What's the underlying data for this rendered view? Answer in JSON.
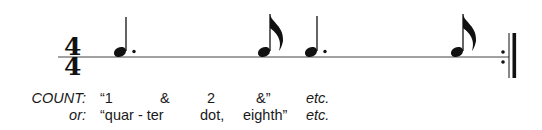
{
  "notation": {
    "time_signature": {
      "numerator": "4",
      "denominator": "4"
    },
    "notes": [
      {
        "type": "dotted-quarter",
        "x": 118
      },
      {
        "type": "eighth",
        "x": 263
      },
      {
        "type": "dotted-quarter",
        "x": 308
      },
      {
        "type": "eighth",
        "x": 457
      }
    ],
    "barline": "end-repeat"
  },
  "counting": {
    "row1": {
      "label": "COUNT:",
      "syllables": [
        "“1",
        "&",
        "2",
        "&”"
      ],
      "etc": "etc."
    },
    "row2": {
      "label": "or:",
      "syllables": [
        "“quar - ter",
        "dot,",
        "eighth”"
      ],
      "etc": "etc."
    }
  },
  "colors": {
    "ink": "#111111",
    "background": "#ffffff"
  }
}
